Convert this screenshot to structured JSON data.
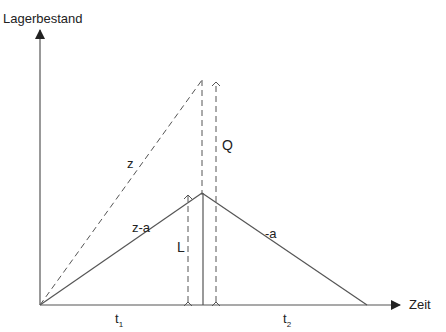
{
  "diagram": {
    "y_axis_label": "Lagerbestand",
    "x_axis_label": "Zeit",
    "lines": {
      "z": "z",
      "z_minus_a": "z-a",
      "minus_a": "-a",
      "Q": "Q",
      "L": "L"
    },
    "intervals": {
      "t1": {
        "base": "t",
        "sub": "1"
      },
      "t2": {
        "base": "t",
        "sub": "2"
      }
    },
    "colors": {
      "line": "#555555",
      "text": "#222222",
      "background": "#ffffff"
    }
  }
}
